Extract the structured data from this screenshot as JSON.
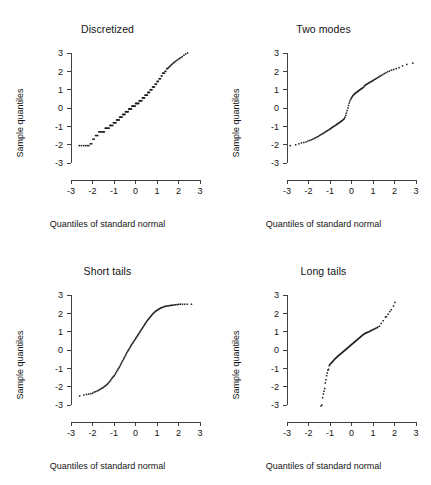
{
  "figure": {
    "panel_count": 4,
    "background": "#ffffff",
    "point_color": "#1c1c1c",
    "axis_color": "#2b2b2b"
  },
  "axes_common": {
    "xlabel": "Quantiles of standard normal",
    "ylabel": "Sample quantiles",
    "xticks": [
      -3,
      -2,
      -1,
      0,
      1,
      2,
      3
    ],
    "yticks": [
      -3,
      -2,
      -1,
      0,
      1,
      2,
      3
    ],
    "xtick_labels": [
      "-3",
      "-2",
      "-1",
      "0",
      "1",
      "2",
      "3"
    ],
    "ytick_labels": [
      "-3",
      "-2",
      "-1",
      "0",
      "1",
      "2",
      "3"
    ],
    "xlim": [
      -3,
      3
    ],
    "ylim": [
      -3,
      3
    ],
    "grid": false,
    "legend": "none"
  },
  "chart_data": [
    {
      "type": "scatter",
      "title": "Discretized",
      "xlabel": "Quantiles of standard normal",
      "ylabel": "Sample quantiles",
      "xlim": [
        -3,
        3
      ],
      "ylim": [
        -3,
        3
      ],
      "x": [
        -2.62,
        -2.52,
        -2.42,
        -2.33,
        -2.25,
        -2.17,
        -2.1,
        -2.04,
        -1.98,
        -1.92,
        -1.86,
        -1.81,
        -1.76,
        -1.71,
        -1.66,
        -1.62,
        -1.57,
        -1.53,
        -1.49,
        -1.45,
        -1.41,
        -1.37,
        -1.34,
        -1.3,
        -1.26,
        -1.23,
        -1.2,
        -1.16,
        -1.13,
        -1.1,
        -1.06,
        -1.03,
        -1.0,
        -0.97,
        -0.94,
        -0.91,
        -0.88,
        -0.85,
        -0.82,
        -0.79,
        -0.76,
        -0.74,
        -0.71,
        -0.68,
        -0.65,
        -0.63,
        -0.6,
        -0.57,
        -0.55,
        -0.52,
        -0.49,
        -0.47,
        -0.44,
        -0.42,
        -0.39,
        -0.37,
        -0.34,
        -0.32,
        -0.29,
        -0.27,
        -0.24,
        -0.22,
        -0.19,
        -0.17,
        -0.15,
        -0.12,
        -0.1,
        -0.07,
        -0.05,
        -0.02,
        0.0,
        0.02,
        0.05,
        0.07,
        0.1,
        0.12,
        0.15,
        0.17,
        0.19,
        0.22,
        0.24,
        0.27,
        0.29,
        0.32,
        0.34,
        0.37,
        0.39,
        0.42,
        0.44,
        0.47,
        0.49,
        0.52,
        0.55,
        0.57,
        0.6,
        0.63,
        0.65,
        0.68,
        0.71,
        0.74,
        0.76,
        0.79,
        0.82,
        0.85,
        0.88,
        0.91,
        0.94,
        0.97,
        1.0,
        1.03,
        1.06,
        1.1,
        1.13,
        1.16,
        1.2,
        1.23,
        1.26,
        1.3,
        1.34,
        1.37,
        1.41,
        1.45,
        1.49,
        1.53,
        1.57,
        1.62,
        1.66,
        1.71,
        1.76,
        1.81,
        1.86,
        1.92,
        1.98,
        2.04,
        2.1,
        2.17,
        2.25,
        2.33,
        2.42,
        2.52,
        2.62
      ],
      "y": [
        -2.05,
        -2.05,
        -2.05,
        -2.05,
        -2.05,
        -2.05,
        -1.95,
        -1.95,
        -1.7,
        -1.7,
        -1.5,
        -1.5,
        -1.5,
        -1.3,
        -1.3,
        -1.3,
        -1.3,
        -1.3,
        -1.3,
        -1.3,
        -1.1,
        -1.1,
        -1.1,
        -1.1,
        -1.1,
        -1.1,
        -0.95,
        -0.95,
        -0.95,
        -0.95,
        -0.95,
        -0.8,
        -0.8,
        -0.8,
        -0.8,
        -0.8,
        -0.65,
        -0.65,
        -0.65,
        -0.65,
        -0.65,
        -0.5,
        -0.5,
        -0.5,
        -0.5,
        -0.5,
        -0.35,
        -0.35,
        -0.35,
        -0.35,
        -0.35,
        -0.2,
        -0.2,
        -0.2,
        -0.2,
        -0.2,
        -0.2,
        -0.05,
        -0.05,
        -0.05,
        -0.05,
        -0.05,
        -0.05,
        0.1,
        0.1,
        0.1,
        0.1,
        0.1,
        0.1,
        0.1,
        0.25,
        0.25,
        0.25,
        0.25,
        0.25,
        0.25,
        0.25,
        0.4,
        0.4,
        0.4,
        0.4,
        0.4,
        0.4,
        0.55,
        0.55,
        0.55,
        0.55,
        0.55,
        0.7,
        0.7,
        0.7,
        0.7,
        0.7,
        0.85,
        0.85,
        0.85,
        0.85,
        1.0,
        1.0,
        1.0,
        1.0,
        1.15,
        1.15,
        1.15,
        1.15,
        1.3,
        1.3,
        1.3,
        1.45,
        1.45,
        1.45,
        1.6,
        1.6,
        1.6,
        1.75,
        1.75,
        1.9,
        1.9,
        1.9,
        2.0,
        2.0,
        2.15,
        2.15,
        2.2,
        2.25,
        2.3,
        2.35,
        2.4,
        2.45,
        2.5,
        2.55,
        2.6,
        2.65,
        2.7,
        2.75,
        2.8,
        2.88,
        2.95,
        3.0
      ]
    },
    {
      "type": "scatter",
      "title": "Two modes",
      "xlabel": "Quantiles of standard normal",
      "ylabel": "Sample quantiles",
      "xlim": [
        -3,
        3
      ],
      "ylim": [
        -3,
        3
      ],
      "x": [
        -2.85,
        -2.6,
        -2.45,
        -2.33,
        -2.22,
        -2.12,
        -2.03,
        -1.95,
        -1.87,
        -1.8,
        -1.73,
        -1.67,
        -1.61,
        -1.55,
        -1.49,
        -1.44,
        -1.38,
        -1.33,
        -1.28,
        -1.24,
        -1.19,
        -1.14,
        -1.1,
        -1.05,
        -1.01,
        -0.97,
        -0.93,
        -0.89,
        -0.85,
        -0.81,
        -0.77,
        -0.73,
        -0.69,
        -0.66,
        -0.62,
        -0.58,
        -0.55,
        -0.51,
        -0.48,
        -0.44,
        -0.41,
        -0.37,
        -0.34,
        -0.31,
        -0.27,
        -0.24,
        -0.21,
        -0.17,
        -0.14,
        -0.11,
        -0.08,
        -0.04,
        -0.01,
        0.02,
        0.05,
        0.08,
        0.12,
        0.15,
        0.18,
        0.21,
        0.25,
        0.28,
        0.31,
        0.35,
        0.38,
        0.42,
        0.45,
        0.49,
        0.52,
        0.56,
        0.6,
        0.63,
        0.67,
        0.71,
        0.75,
        0.79,
        0.83,
        0.88,
        0.92,
        0.97,
        1.01,
        1.06,
        1.11,
        1.16,
        1.22,
        1.27,
        1.33,
        1.39,
        1.46,
        1.53,
        1.6,
        1.68,
        1.77,
        1.86,
        1.96,
        2.08,
        2.21,
        2.37,
        2.57,
        2.85
      ],
      "y": [
        -2.05,
        -2.0,
        -1.95,
        -1.9,
        -1.88,
        -1.85,
        -1.8,
        -1.77,
        -1.73,
        -1.7,
        -1.66,
        -1.62,
        -1.58,
        -1.55,
        -1.5,
        -1.46,
        -1.42,
        -1.39,
        -1.35,
        -1.32,
        -1.28,
        -1.25,
        -1.22,
        -1.18,
        -1.15,
        -1.12,
        -1.08,
        -1.05,
        -1.02,
        -0.99,
        -0.96,
        -0.93,
        -0.9,
        -0.87,
        -0.84,
        -0.81,
        -0.78,
        -0.75,
        -0.72,
        -0.69,
        -0.66,
        -0.62,
        -0.58,
        -0.5,
        -0.4,
        -0.28,
        -0.14,
        0.0,
        0.14,
        0.27,
        0.38,
        0.47,
        0.54,
        0.6,
        0.65,
        0.7,
        0.74,
        0.78,
        0.81,
        0.84,
        0.87,
        0.9,
        0.93,
        0.96,
        0.99,
        1.02,
        1.05,
        1.07,
        1.1,
        1.14,
        1.2,
        1.24,
        1.27,
        1.3,
        1.33,
        1.36,
        1.39,
        1.42,
        1.45,
        1.48,
        1.51,
        1.55,
        1.58,
        1.62,
        1.66,
        1.7,
        1.74,
        1.78,
        1.83,
        1.88,
        1.93,
        1.98,
        2.02,
        2.07,
        2.1,
        2.15,
        2.2,
        2.3,
        2.38,
        2.45
      ]
    },
    {
      "type": "scatter",
      "title": "Short tails",
      "xlabel": "Quantiles of standard normal",
      "ylabel": "Sample quantiles",
      "xlim": [
        -3,
        3
      ],
      "ylim": [
        -3,
        3
      ],
      "x": [
        -2.6,
        -2.4,
        -2.28,
        -2.18,
        -2.08,
        -2.0,
        -1.93,
        -1.86,
        -1.79,
        -1.73,
        -1.67,
        -1.62,
        -1.56,
        -1.51,
        -1.46,
        -1.41,
        -1.37,
        -1.32,
        -1.28,
        -1.23,
        -1.19,
        -1.15,
        -1.11,
        -1.07,
        -1.03,
        -0.99,
        -0.95,
        -0.92,
        -0.88,
        -0.84,
        -0.81,
        -0.77,
        -0.74,
        -0.7,
        -0.67,
        -0.63,
        -0.6,
        -0.56,
        -0.53,
        -0.5,
        -0.46,
        -0.43,
        -0.4,
        -0.36,
        -0.33,
        -0.3,
        -0.26,
        -0.23,
        -0.2,
        -0.17,
        -0.13,
        -0.1,
        -0.07,
        -0.03,
        0.0,
        0.03,
        0.07,
        0.1,
        0.13,
        0.17,
        0.2,
        0.23,
        0.26,
        0.3,
        0.33,
        0.36,
        0.4,
        0.43,
        0.46,
        0.5,
        0.53,
        0.56,
        0.6,
        0.63,
        0.67,
        0.7,
        0.74,
        0.77,
        0.81,
        0.84,
        0.88,
        0.92,
        0.95,
        0.99,
        1.03,
        1.07,
        1.11,
        1.15,
        1.19,
        1.23,
        1.28,
        1.32,
        1.37,
        1.41,
        1.46,
        1.51,
        1.56,
        1.62,
        1.67,
        1.73,
        1.79,
        1.86,
        1.93,
        2.0,
        2.08,
        2.18,
        2.28,
        2.4,
        2.6
      ],
      "y": [
        -2.5,
        -2.45,
        -2.42,
        -2.4,
        -2.38,
        -2.35,
        -2.3,
        -2.27,
        -2.24,
        -2.2,
        -2.16,
        -2.12,
        -2.08,
        -2.05,
        -2.0,
        -1.96,
        -1.92,
        -1.87,
        -1.82,
        -1.76,
        -1.7,
        -1.63,
        -1.56,
        -1.5,
        -1.45,
        -1.4,
        -1.33,
        -1.25,
        -1.17,
        -1.1,
        -1.03,
        -0.97,
        -0.9,
        -0.82,
        -0.74,
        -0.66,
        -0.58,
        -0.5,
        -0.43,
        -0.36,
        -0.28,
        -0.2,
        -0.13,
        -0.06,
        0.0,
        0.06,
        0.13,
        0.2,
        0.26,
        0.32,
        0.38,
        0.44,
        0.5,
        0.56,
        0.62,
        0.68,
        0.74,
        0.8,
        0.86,
        0.92,
        0.98,
        1.04,
        1.1,
        1.16,
        1.22,
        1.28,
        1.34,
        1.4,
        1.46,
        1.52,
        1.58,
        1.63,
        1.68,
        1.73,
        1.78,
        1.83,
        1.88,
        1.93,
        1.98,
        2.02,
        2.06,
        2.1,
        2.13,
        2.16,
        2.19,
        2.22,
        2.25,
        2.28,
        2.3,
        2.32,
        2.34,
        2.36,
        2.38,
        2.39,
        2.4,
        2.41,
        2.42,
        2.43,
        2.44,
        2.45,
        2.46,
        2.47,
        2.48,
        2.49,
        2.5,
        2.5,
        2.5,
        2.5,
        2.5
      ]
    },
    {
      "type": "scatter",
      "title": "Long tails",
      "xlabel": "Quantiles of standard normal",
      "ylabel": "Sample quantiles",
      "xlim": [
        -3,
        3
      ],
      "ylim": [
        -3,
        3
      ],
      "x": [
        -1.42,
        -1.38,
        -1.35,
        -1.31,
        -1.28,
        -1.25,
        -1.22,
        -1.19,
        -1.16,
        -1.13,
        -1.1,
        -1.07,
        -1.04,
        -1.01,
        -0.98,
        -0.95,
        -0.92,
        -0.89,
        -0.86,
        -0.83,
        -0.8,
        -0.77,
        -0.74,
        -0.71,
        -0.68,
        -0.65,
        -0.62,
        -0.59,
        -0.56,
        -0.53,
        -0.5,
        -0.47,
        -0.44,
        -0.41,
        -0.38,
        -0.35,
        -0.32,
        -0.29,
        -0.26,
        -0.23,
        -0.2,
        -0.17,
        -0.14,
        -0.11,
        -0.08,
        -0.05,
        -0.02,
        0.01,
        0.04,
        0.07,
        0.1,
        0.13,
        0.16,
        0.19,
        0.22,
        0.25,
        0.28,
        0.31,
        0.34,
        0.37,
        0.4,
        0.43,
        0.46,
        0.49,
        0.52,
        0.56,
        0.59,
        0.62,
        0.66,
        0.69,
        0.73,
        0.77,
        0.81,
        0.85,
        0.89,
        0.93,
        0.98,
        1.03,
        1.08,
        1.13,
        1.19,
        1.22,
        1.3,
        1.38,
        1.47,
        1.58,
        1.62,
        1.7,
        1.78,
        1.85,
        1.95,
        2.02
      ],
      "y": [
        -3.05,
        -3.0,
        -2.6,
        -2.4,
        -2.25,
        -2.1,
        -1.8,
        -1.62,
        -1.4,
        -1.25,
        -1.1,
        -1.05,
        -0.85,
        -0.8,
        -0.75,
        -0.72,
        -0.68,
        -0.64,
        -0.6,
        -0.56,
        -0.52,
        -0.48,
        -0.45,
        -0.42,
        -0.38,
        -0.35,
        -0.32,
        -0.29,
        -0.26,
        -0.23,
        -0.2,
        -0.17,
        -0.14,
        -0.11,
        -0.08,
        -0.05,
        -0.02,
        0.01,
        0.04,
        0.07,
        0.1,
        0.13,
        0.16,
        0.19,
        0.22,
        0.25,
        0.28,
        0.31,
        0.34,
        0.37,
        0.4,
        0.43,
        0.46,
        0.49,
        0.52,
        0.55,
        0.58,
        0.61,
        0.64,
        0.67,
        0.7,
        0.73,
        0.76,
        0.79,
        0.82,
        0.85,
        0.88,
        0.9,
        0.92,
        0.94,
        0.96,
        0.98,
        1.0,
        1.02,
        1.05,
        1.08,
        1.1,
        1.13,
        1.16,
        1.19,
        1.22,
        1.25,
        1.3,
        1.45,
        1.6,
        1.8,
        1.82,
        1.95,
        2.1,
        2.2,
        2.4,
        2.6
      ]
    }
  ]
}
